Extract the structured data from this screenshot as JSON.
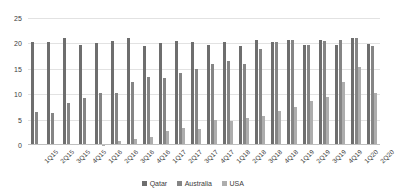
{
  "chart_data": {
    "type": "bar",
    "title": "",
    "subtitle": "",
    "xlabel": "",
    "ylabel": "",
    "ylim": [
      0,
      25
    ],
    "yticks": [
      0,
      5,
      10,
      15,
      20,
      25
    ],
    "grid": true,
    "legend_position": "bottom",
    "categories": [
      "1Q15",
      "2Q15",
      "3Q15",
      "4Q15",
      "1Q16",
      "2Q16",
      "3Q16",
      "4Q16",
      "1Q17",
      "2Q17",
      "3Q17",
      "4Q17",
      "1Q18",
      "2Q18",
      "3Q18",
      "4Q18",
      "1Q19",
      "2Q19",
      "3Q19",
      "4Q19",
      "1Q20",
      "2Q20"
    ],
    "series": [
      {
        "name": "Qatar",
        "color": "#6e6e6e",
        "values": [
          20.2,
          20.3,
          21.0,
          19.7,
          20.1,
          20.4,
          21.1,
          19.4,
          20.1,
          20.5,
          20.2,
          19.6,
          20.3,
          19.5,
          20.6,
          20.2,
          20.7,
          19.7,
          20.6,
          19.6,
          21.0,
          19.9
        ]
      },
      {
        "name": "Australia",
        "color": "#858585",
        "values": [
          6.5,
          6.4,
          8.2,
          9.3,
          10.3,
          10.2,
          12.4,
          13.4,
          13.2,
          14.2,
          14.9,
          15.9,
          16.5,
          15.9,
          18.9,
          20.3,
          20.6,
          19.6,
          20.5,
          20.6,
          21.1,
          19.5
        ]
      },
      {
        "name": "USA",
        "color": "#adadad",
        "values": [
          0.0,
          0.0,
          0.0,
          0.0,
          0.1,
          0.8,
          1.2,
          1.5,
          2.8,
          3.4,
          3.2,
          5.0,
          4.8,
          5.3,
          5.8,
          6.6,
          7.5,
          8.7,
          9.5,
          12.4,
          15.3,
          10.3
        ]
      }
    ]
  },
  "legend": {
    "items": [
      {
        "label": "Qatar"
      },
      {
        "label": "Australia"
      },
      {
        "label": "USA"
      }
    ]
  }
}
